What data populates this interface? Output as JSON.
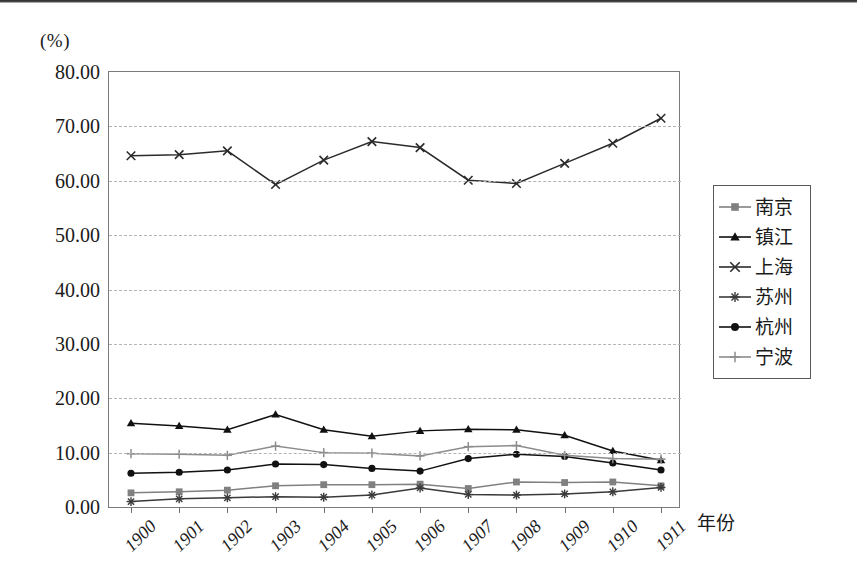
{
  "axis": {
    "unit_label": "(%)",
    "x_axis_title": "年份",
    "y_ticks": [
      "80.00",
      "70.00",
      "60.00",
      "50.00",
      "40.00",
      "30.00",
      "20.00",
      "10.00",
      "0.00"
    ],
    "x_ticks": [
      "1900",
      "1901",
      "1902",
      "1903",
      "1904",
      "1905",
      "1906",
      "1907",
      "1908",
      "1909",
      "1910",
      "1911"
    ]
  },
  "legend": {
    "items": [
      {
        "label": "南京",
        "marker": "square",
        "color": "#808080"
      },
      {
        "label": "镇江",
        "marker": "triangle",
        "color": "#111111"
      },
      {
        "label": "上海",
        "marker": "cross-x",
        "color": "#2b2b2b"
      },
      {
        "label": "苏州",
        "marker": "asterisk",
        "color": "#3a3a3a"
      },
      {
        "label": "杭州",
        "marker": "circle",
        "color": "#111111"
      },
      {
        "label": "宁波",
        "marker": "plus",
        "color": "#8c8c8c"
      }
    ]
  },
  "chart_data": {
    "type": "line",
    "title": "",
    "xlabel": "年份",
    "ylabel": "(%)",
    "ylim": [
      0,
      80
    ],
    "ytick_step": 10,
    "grid": true,
    "legend_position": "right",
    "x": [
      "1900",
      "1901",
      "1902",
      "1903",
      "1904",
      "1905",
      "1906",
      "1907",
      "1908",
      "1909",
      "1910",
      "1911"
    ],
    "series": [
      {
        "name": "南京",
        "marker": "square",
        "color": "#808080",
        "values": [
          2.6,
          2.8,
          3.1,
          3.9,
          4.1,
          4.1,
          4.2,
          3.4,
          4.6,
          4.5,
          4.6,
          3.9
        ]
      },
      {
        "name": "镇江",
        "marker": "triangle",
        "color": "#111111",
        "values": [
          15.4,
          14.9,
          14.2,
          17.0,
          14.2,
          13.0,
          14.0,
          14.3,
          14.2,
          13.2,
          10.3,
          8.6
        ]
      },
      {
        "name": "上海",
        "marker": "cross-x",
        "color": "#2b2b2b",
        "values": [
          64.6,
          64.8,
          65.5,
          59.3,
          63.8,
          67.2,
          66.1,
          60.1,
          59.5,
          63.2,
          66.9,
          71.5
        ]
      },
      {
        "name": "苏州",
        "marker": "asterisk",
        "color": "#3a3a3a",
        "values": [
          1.0,
          1.5,
          1.7,
          1.9,
          1.8,
          2.2,
          3.5,
          2.3,
          2.2,
          2.4,
          2.8,
          3.6
        ]
      },
      {
        "name": "杭州",
        "marker": "circle",
        "color": "#111111",
        "values": [
          6.2,
          6.4,
          6.8,
          7.9,
          7.8,
          7.1,
          6.6,
          8.9,
          9.7,
          9.3,
          8.1,
          6.8
        ]
      },
      {
        "name": "宁波",
        "marker": "plus",
        "color": "#8c8c8c",
        "values": [
          9.8,
          9.7,
          9.5,
          11.2,
          10.0,
          9.9,
          9.4,
          11.1,
          11.3,
          9.5,
          8.9,
          8.8
        ]
      }
    ]
  }
}
